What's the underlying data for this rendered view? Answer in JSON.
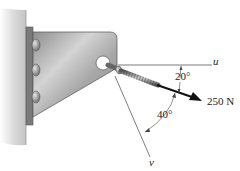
{
  "figure": {
    "force": {
      "magnitude_label": "250 N",
      "color": "#111111"
    },
    "axes": {
      "u_label": "u",
      "v_label": "v"
    },
    "angles": {
      "force_to_u": "20°",
      "force_to_v": "40°"
    },
    "components": [
      "wall",
      "bracket",
      "bolts",
      "eye-bolt",
      "force-arrow"
    ]
  }
}
